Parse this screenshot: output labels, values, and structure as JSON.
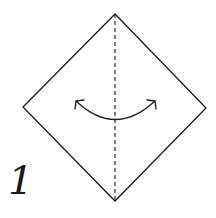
{
  "diagram": {
    "type": "origami-fold-step",
    "step_number": "1",
    "colors": {
      "line": "#1a1a1a",
      "background": "#ffffff"
    },
    "shape": {
      "name": "square-diamond",
      "points": [
        [
          115,
          14
        ],
        [
          206,
          108
        ],
        [
          115,
          201
        ],
        [
          23,
          107
        ]
      ]
    },
    "fold_line": {
      "style": "dashed",
      "from": [
        115,
        14
      ],
      "to": [
        115,
        201
      ],
      "meaning": "valley fold"
    },
    "arrow": {
      "style": "double-headed curved",
      "meaning": "fold and unfold"
    }
  }
}
